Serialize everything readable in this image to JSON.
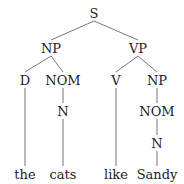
{
  "tree": {
    "nodes": [
      {
        "id": "s",
        "label": "S",
        "x": 94,
        "y": 13
      },
      {
        "id": "np1",
        "label": "NP",
        "x": 51,
        "y": 48
      },
      {
        "id": "vp",
        "label": "VP",
        "x": 138,
        "y": 48
      },
      {
        "id": "d",
        "label": "D",
        "x": 25,
        "y": 80
      },
      {
        "id": "nom1",
        "label": "NOM",
        "x": 63,
        "y": 80
      },
      {
        "id": "v",
        "label": "V",
        "x": 116,
        "y": 80
      },
      {
        "id": "np2",
        "label": "NP",
        "x": 157,
        "y": 80
      },
      {
        "id": "n1",
        "label": "N",
        "x": 63,
        "y": 111
      },
      {
        "id": "nom2",
        "label": "NOM",
        "x": 157,
        "y": 111
      },
      {
        "id": "n2",
        "label": "N",
        "x": 157,
        "y": 143
      },
      {
        "id": "w1",
        "label": "the",
        "x": 25,
        "y": 174
      },
      {
        "id": "w2",
        "label": "cats",
        "x": 63,
        "y": 174
      },
      {
        "id": "w3",
        "label": "like",
        "x": 116,
        "y": 174
      },
      {
        "id": "w4",
        "label": "Sandy",
        "x": 157,
        "y": 174
      }
    ],
    "edges": [
      [
        94,
        21,
        51,
        40
      ],
      [
        94,
        21,
        138,
        40
      ],
      [
        51,
        56,
        25,
        72
      ],
      [
        51,
        56,
        63,
        72
      ],
      [
        138,
        56,
        116,
        72
      ],
      [
        138,
        56,
        157,
        72
      ],
      [
        25,
        88,
        25,
        166
      ],
      [
        63,
        88,
        63,
        103
      ],
      [
        63,
        119,
        63,
        166
      ],
      [
        116,
        88,
        116,
        166
      ],
      [
        157,
        88,
        157,
        103
      ],
      [
        157,
        119,
        157,
        135
      ],
      [
        157,
        151,
        157,
        166
      ]
    ],
    "line_color": "#666666"
  }
}
